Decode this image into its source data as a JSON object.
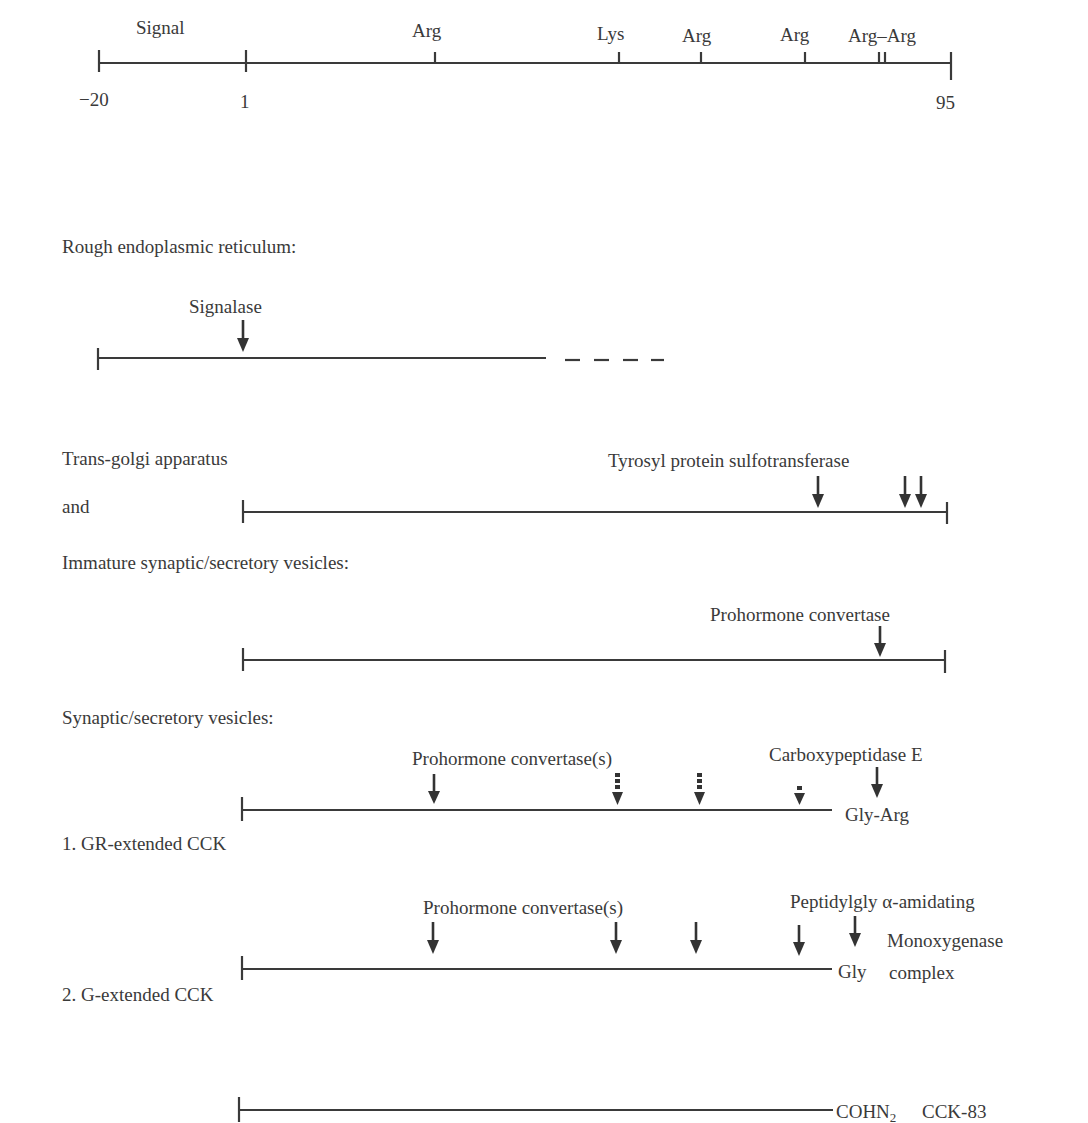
{
  "figure": {
    "scale": {
      "labels": {
        "signal": "Signal",
        "arg1": "Arg",
        "lys": "Lys",
        "arg2": "Arg",
        "arg3": "Arg",
        "arg_arg": "Arg–Arg"
      },
      "ticks": {
        "start": "−20",
        "one": "1",
        "end": "95"
      }
    },
    "stages": {
      "rer": {
        "title": "Rough endoplasmic reticulum:",
        "enzyme": "Signalase"
      },
      "golgi": {
        "title_line1": "Trans-golgi apparatus",
        "title_line2": "and",
        "enzyme": "Tyrosyl protein sulfotransferase"
      },
      "immature": {
        "title": "Immature synaptic/secretory vesicles:",
        "enzyme": "Prohormone convertase"
      },
      "vesicles": {
        "title": "Synaptic/secretory vesicles:",
        "gr": {
          "enzyme1": "Prohormone convertase(s)",
          "enzyme2": "Carboxypeptidase E",
          "terminus": "Gly-Arg",
          "caption": "1. GR-extended CCK"
        },
        "g": {
          "enzyme1": "Prohormone convertase(s)",
          "enzyme2_line1": "Peptidylgly α-amidating",
          "enzyme2_line2": "Monoxygenase",
          "enzyme2_line3": "complex",
          "terminus": "Gly",
          "caption": "2. G-extended CCK"
        }
      },
      "final": {
        "terminus_main": "COHN",
        "terminus_sub": "2",
        "product": "CCK-83"
      }
    },
    "colors": {
      "line": "#3a3a3a",
      "text": "#3a3a3a",
      "background": "#ffffff"
    }
  }
}
